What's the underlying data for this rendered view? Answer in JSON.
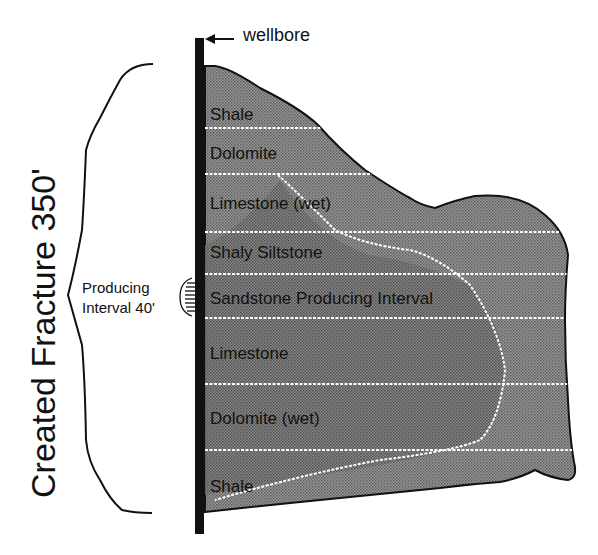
{
  "diagram": {
    "vertical_title": "Created Fracture 350'",
    "wellbore_label": "wellbore",
    "producing_interval": {
      "line1": "Producing",
      "line2": "Interval 40'"
    },
    "layers": [
      {
        "label": "Shale"
      },
      {
        "label": "Dolomite"
      },
      {
        "label": "Limestone (wet)"
      },
      {
        "label": "Shaly Siltstone"
      },
      {
        "label": "Sandstone Producing Interval"
      },
      {
        "label": "Limestone"
      },
      {
        "label": "Dolomite (wet)"
      },
      {
        "label": "Shale"
      }
    ],
    "colors": {
      "fracture_fill": "#8c8c8c",
      "wellbore": "#111111",
      "layer_line": "#ffffff"
    }
  }
}
